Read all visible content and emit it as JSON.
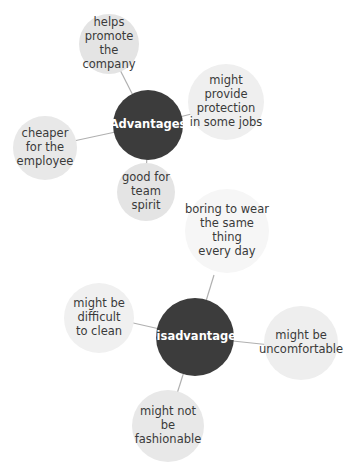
{
  "diagram": {
    "type": "mind-map",
    "colors": {
      "hub_fill": "#3c3c3c",
      "hub_text": "#ffffff",
      "leaf_fill": "#e6e6e6",
      "leaf_fill_faint": "#f1f1f1",
      "leaf_text": "#3a3a3a",
      "connector": "#b0b0b0"
    },
    "advantages": {
      "label": "Advantages",
      "items": [
        {
          "label": "helps\npromote\nthe\ncompany"
        },
        {
          "label": "might\nprovide\nprotection\nin some jobs"
        },
        {
          "label": "cheaper\nfor the\nemployee"
        },
        {
          "label": "good for\nteam\nspirit"
        }
      ]
    },
    "disadvantages": {
      "label": "Disadvantages",
      "items": [
        {
          "label": "boring to wear\nthe same thing\nevery day"
        },
        {
          "label": "might be\ndifficult\nto clean"
        },
        {
          "label": "might be\nuncomfortable"
        },
        {
          "label": "might not be\nfashionable"
        }
      ]
    }
  }
}
